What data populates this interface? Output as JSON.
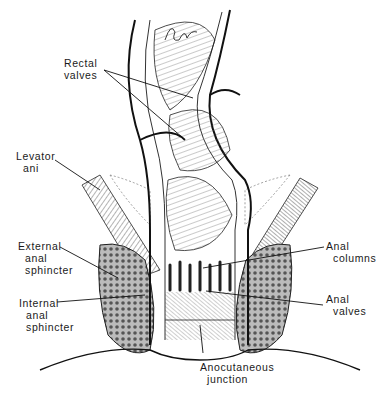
{
  "figure": {
    "type": "anatomical line illustration",
    "signature": "Peter Stone"
  },
  "labels": [
    {
      "id": "rectal-valves",
      "line1": "Rectal",
      "line2": "valves"
    },
    {
      "id": "levator-ani",
      "line1": "Levator",
      "line2": "ani"
    },
    {
      "id": "external-anal-sphincter",
      "line1": "External",
      "line2": "anal",
      "line3": "sphincter"
    },
    {
      "id": "internal-anal-sphincter",
      "line1": "Internal",
      "line2": "anal",
      "line3": "sphincter"
    },
    {
      "id": "anal-columns",
      "line1": "Anal",
      "line2": "columns"
    },
    {
      "id": "anal-valves",
      "line1": "Anal",
      "line2": "valves"
    },
    {
      "id": "anocutaneous-junction",
      "line1": "Anocutaneous",
      "line2": "junction"
    }
  ],
  "colors": {
    "ink": "#1a1a1a",
    "paper": "#ffffff",
    "shade": "#555555"
  }
}
